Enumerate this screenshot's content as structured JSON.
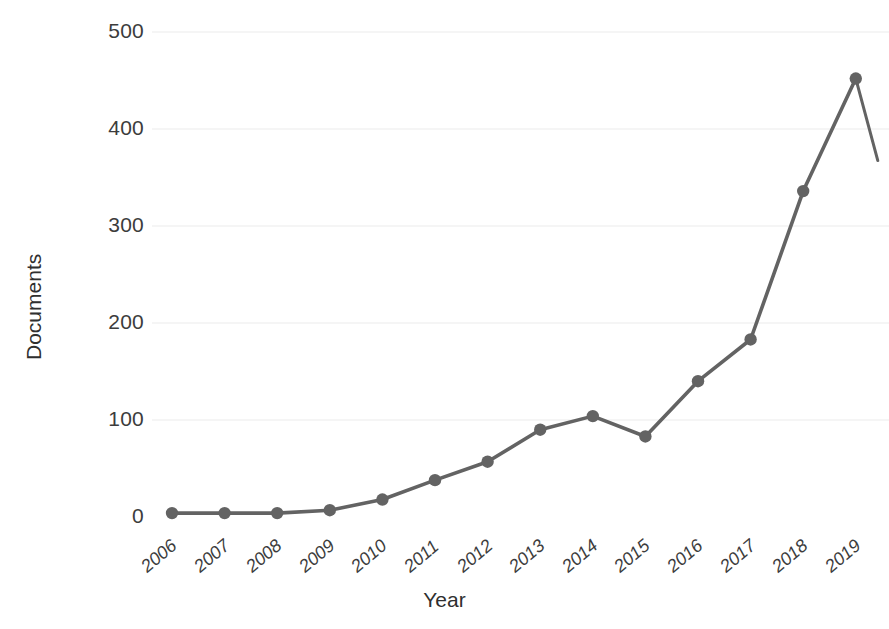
{
  "chart_data": {
    "type": "line",
    "title": "",
    "xlabel": "Year",
    "ylabel": "Documents",
    "categories": [
      "2006",
      "2007",
      "2008",
      "2009",
      "2010",
      "2011",
      "2012",
      "2013",
      "2014",
      "2015",
      "2016",
      "2017",
      "2018",
      "2019"
    ],
    "values": [
      4,
      4,
      4,
      7,
      18,
      38,
      57,
      90,
      104,
      83,
      140,
      183,
      336,
      452
    ],
    "series": [
      {
        "name": "Documents",
        "values": [
          4,
          4,
          4,
          7,
          18,
          38,
          57,
          90,
          104,
          83,
          140,
          183,
          336,
          452
        ]
      }
    ],
    "ylim": [
      0,
      500
    ],
    "yticks": [
      0,
      100,
      200,
      300,
      400,
      500
    ],
    "ytick_labels": [
      "0",
      "100",
      "200",
      "300",
      "400",
      "500"
    ],
    "xtick_labels": [
      "2006",
      "2007",
      "2008",
      "2009",
      "2010",
      "2011",
      "2012",
      "2013",
      "2014",
      "2015",
      "2016",
      "2017",
      "2018",
      "2019"
    ],
    "grid": true,
    "grid_axis": "y",
    "legend": false,
    "legend_position": "none",
    "line_color": "#636363",
    "marker_color": "#636363",
    "marker_shape": "circle",
    "grid_color": "#f2f2f2",
    "text_color": "#3c3c3c",
    "background_color": "#ffffff",
    "annotations": [
      "Line continues downward past the right edge after the 2019 point (partial segment clipped at plot boundary)."
    ]
  },
  "axes": {
    "y_label_text": "Documents",
    "x_label_text": "Year"
  }
}
